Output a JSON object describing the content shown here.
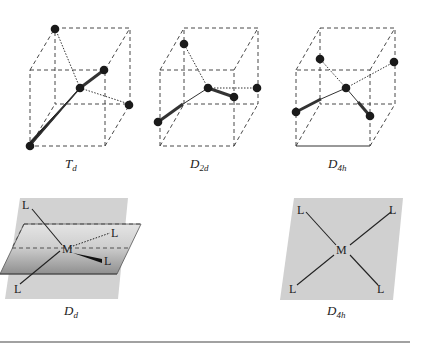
{
  "figure": {
    "top_row": [
      {
        "id": "Td",
        "label_main": "T",
        "label_sub": "d",
        "atoms": [
          [
            55,
            28
          ],
          [
            104,
            70
          ],
          [
            80,
            88
          ],
          [
            129,
            104
          ],
          [
            30,
            146
          ]
        ],
        "center": [
          80,
          88
        ]
      },
      {
        "id": "D2d",
        "label_main": "D",
        "label_sub": "2d",
        "atoms": [
          [
            184,
            44
          ],
          [
            208,
            88
          ],
          [
            234,
            97
          ],
          [
            257,
            88
          ],
          [
            158,
            122
          ]
        ],
        "center": [
          208,
          88
        ]
      },
      {
        "id": "D4h",
        "label_main": "D",
        "label_sub": "4h",
        "atoms": [
          [
            320,
            59
          ],
          [
            394,
            62
          ],
          [
            346,
            88
          ],
          [
            370,
            116
          ],
          [
            296,
            112
          ]
        ],
        "center": [
          346,
          88
        ]
      }
    ],
    "bottom_row": [
      {
        "id": "Td-planes",
        "label_main": "T",
        "label_sub": "d",
        "metal": "M",
        "ligands": [
          "L",
          "L",
          "L",
          "L"
        ]
      },
      {
        "id": "D4h-plane",
        "label_main": "D",
        "label_sub": "4h",
        "metal": "M",
        "ligands": [
          "L",
          "L",
          "L",
          "L"
        ]
      }
    ],
    "colors": {
      "plane_gray": "#cfcfcf",
      "plane_dark": "#9a9a9a",
      "line": "#222222",
      "rule": "#444444"
    }
  }
}
